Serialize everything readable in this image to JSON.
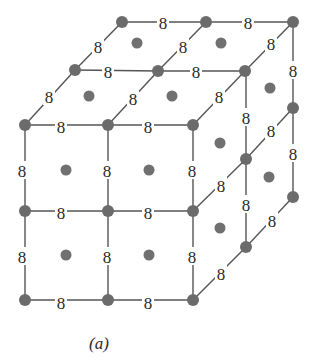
{
  "figure": {
    "caption": "(a)",
    "edge_label": "8",
    "colors": {
      "node": "#6b6b6b",
      "edge": "#555555",
      "label": "#2a2a2a",
      "background": "#ffffff"
    }
  },
  "nodes": [
    [
      122,
      22
    ],
    [
      206,
      22
    ],
    [
      293,
      22
    ],
    [
      75,
      70
    ],
    [
      158,
      71
    ],
    [
      245,
      71
    ],
    [
      25,
      125
    ],
    [
      108,
      125
    ],
    [
      193,
      125
    ],
    [
      293,
      108
    ],
    [
      293,
      197
    ],
    [
      246,
      159
    ],
    [
      246,
      247
    ],
    [
      25,
      211
    ],
    [
      108,
      211
    ],
    [
      193,
      211
    ],
    [
      25,
      300
    ],
    [
      108,
      300
    ],
    [
      193,
      300
    ]
  ],
  "face_centers": [
    [
      137,
      43
    ],
    [
      221,
      43
    ],
    [
      89,
      96
    ],
    [
      172,
      96
    ],
    [
      66,
      170
    ],
    [
      149,
      170
    ],
    [
      66,
      255
    ],
    [
      149,
      255
    ],
    [
      220,
      143
    ],
    [
      270,
      88
    ],
    [
      220,
      228
    ],
    [
      269,
      177
    ]
  ],
  "edges": [
    [
      [
        122,
        22
      ],
      [
        206,
        22
      ],
      [
        163,
        22
      ]
    ],
    [
      [
        206,
        22
      ],
      [
        293,
        22
      ],
      [
        248,
        22
      ]
    ],
    [
      [
        75,
        70
      ],
      [
        158,
        71
      ],
      [
        108,
        71
      ]
    ],
    [
      [
        158,
        71
      ],
      [
        245,
        71
      ],
      [
        196,
        71
      ]
    ],
    [
      [
        25,
        125
      ],
      [
        108,
        125
      ],
      [
        61,
        126
      ]
    ],
    [
      [
        108,
        125
      ],
      [
        193,
        125
      ],
      [
        148,
        126
      ]
    ],
    [
      [
        122,
        22
      ],
      [
        75,
        70
      ],
      [
        98,
        46
      ]
    ],
    [
      [
        75,
        70
      ],
      [
        25,
        125
      ],
      [
        49,
        96
      ]
    ],
    [
      [
        206,
        22
      ],
      [
        158,
        71
      ],
      [
        183,
        46
      ]
    ],
    [
      [
        158,
        71
      ],
      [
        108,
        125
      ],
      [
        133,
        98
      ]
    ],
    [
      [
        293,
        22
      ],
      [
        245,
        71
      ],
      [
        271,
        43
      ]
    ],
    [
      [
        245,
        71
      ],
      [
        193,
        125
      ],
      [
        219,
        96
      ]
    ],
    [
      [
        293,
        22
      ],
      [
        293,
        108
      ],
      [
        293,
        70
      ]
    ],
    [
      [
        293,
        108
      ],
      [
        293,
        197
      ],
      [
        293,
        153
      ]
    ],
    [
      [
        246,
        71
      ],
      [
        246,
        159
      ],
      [
        246,
        117
      ]
    ],
    [
      [
        246,
        159
      ],
      [
        246,
        247
      ],
      [
        246,
        204
      ]
    ],
    [
      [
        293,
        108
      ],
      [
        246,
        159
      ],
      [
        271,
        130
      ]
    ],
    [
      [
        246,
        159
      ],
      [
        193,
        211
      ],
      [
        221,
        185
      ]
    ],
    [
      [
        293,
        197
      ],
      [
        246,
        247
      ],
      [
        272,
        220
      ]
    ],
    [
      [
        246,
        247
      ],
      [
        193,
        300
      ],
      [
        221,
        273
      ]
    ],
    [
      [
        25,
        125
      ],
      [
        25,
        211
      ],
      [
        22,
        170
      ]
    ],
    [
      [
        25,
        211
      ],
      [
        25,
        300
      ],
      [
        22,
        256
      ]
    ],
    [
      [
        108,
        125
      ],
      [
        108,
        211
      ],
      [
        107,
        170
      ]
    ],
    [
      [
        108,
        211
      ],
      [
        108,
        300
      ],
      [
        107,
        256
      ]
    ],
    [
      [
        193,
        125
      ],
      [
        193,
        211
      ],
      [
        192,
        170
      ]
    ],
    [
      [
        193,
        211
      ],
      [
        193,
        300
      ],
      [
        192,
        256
      ]
    ],
    [
      [
        25,
        211
      ],
      [
        108,
        211
      ],
      [
        61,
        212
      ]
    ],
    [
      [
        108,
        211
      ],
      [
        193,
        211
      ],
      [
        148,
        212
      ]
    ],
    [
      [
        25,
        300
      ],
      [
        108,
        300
      ],
      [
        61,
        302
      ]
    ],
    [
      [
        108,
        300
      ],
      [
        193,
        300
      ],
      [
        148,
        302
      ]
    ]
  ]
}
